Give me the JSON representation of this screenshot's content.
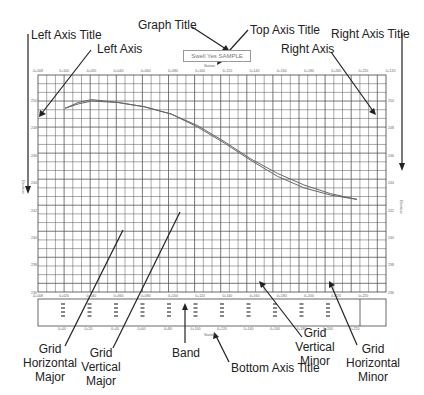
{
  "annotations": {
    "graph_title": "Graph Title",
    "top_axis_title": "Top Axis Title",
    "left_axis_title": "Left Axis Title",
    "left_axis": "Left Axis",
    "right_axis": "Right Axis",
    "right_axis_title": "Right Axis Title",
    "grid_horizontal_major": "Grid Horizontal Major",
    "grid_vertical_major": "Grid Vertical Major",
    "band": "Band",
    "bottom_axis_title": "Bottom Axis Title",
    "grid_vertical_minor": "Grid Vertical Minor",
    "grid_horizontal_minor": "Grid Horizontal Minor"
  },
  "graph": {
    "title_box_text": "Swell Yes SAMPLE",
    "top_axis_title": "Station",
    "bottom_axis_title": "Station",
    "left_axis_title": "Elevation",
    "right_axis_title": "Elevation",
    "top_ticks": [
      "-0+008",
      "0+100",
      "0+020",
      "0+040",
      "0+060",
      "0+080",
      "0+100",
      "0+120",
      "0+140",
      "0+160",
      "0+180",
      "0+200",
      "0+220",
      "0+120"
    ],
    "bottom_ticks": [
      "-0+008",
      "0+020",
      "0+040",
      "0+060",
      "0+080",
      "0+100",
      "0+120",
      "0+140",
      "0+160",
      "0+180",
      "0+200",
      "0+220",
      "0+220"
    ],
    "left_ticks": [
      "250",
      "248",
      "246",
      "244",
      "242",
      "240",
      "238",
      "236"
    ],
    "right_ticks": [
      "250",
      "248",
      "246",
      "244",
      "242",
      "240",
      "238",
      "236"
    ],
    "band_labels": [
      "0+00",
      "0+20",
      "0+40",
      "0+60",
      "0+80",
      "0+100",
      "0+120",
      "0+140",
      "0+160",
      "0+180",
      "0+200",
      "0+220"
    ]
  },
  "colors": {
    "grid": "#555555",
    "curve": "#666666",
    "arrow": "#222222",
    "background": "#ffffff"
  },
  "chart_data": {
    "type": "line",
    "title": "Swell Yes SAMPLE",
    "xlabel": "Station",
    "ylabel": "Elevation",
    "series": [
      {
        "name": "Profile 1",
        "x": [
          0,
          10,
          20,
          40,
          60,
          80,
          100,
          120,
          140,
          160,
          180,
          200,
          220
        ],
        "values": [
          248.7,
          249.1,
          249.3,
          249.1,
          248.8,
          248.3,
          247.5,
          246.4,
          245.2,
          244.2,
          243.4,
          242.8,
          242.4
        ]
      },
      {
        "name": "Profile 2",
        "x": [
          0,
          10,
          20,
          40,
          60,
          80,
          100,
          120,
          140,
          160,
          180,
          200,
          220
        ],
        "values": [
          248.7,
          249.0,
          249.2,
          249.1,
          248.8,
          248.3,
          247.4,
          246.3,
          245.1,
          244.0,
          243.2,
          242.7,
          242.4
        ]
      }
    ],
    "ylim": [
      236,
      251
    ],
    "grid": true
  }
}
